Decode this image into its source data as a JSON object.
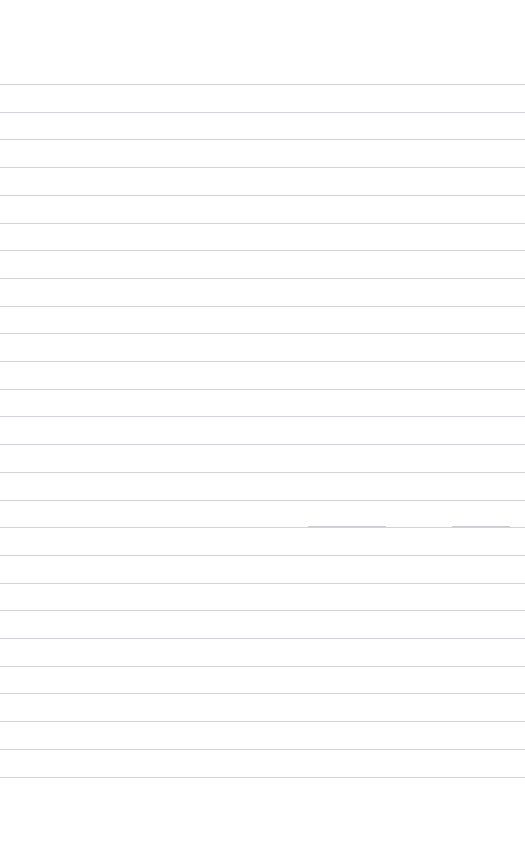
{
  "page": {
    "width": 525,
    "height": 862,
    "background_color": "#ffffff",
    "content_text": "",
    "state": "blank"
  },
  "ruling": {
    "style": "wide-ruled",
    "line_count": 26,
    "first_line_y": 84,
    "line_spacing": 27.7,
    "line_color": "#c8ccd2",
    "line_thickness": 1,
    "line_inset_left": 0,
    "line_inset_right": 0,
    "top_margin": 84,
    "bottom_margin": 86,
    "has_vertical_margin_rule": false,
    "lines_y": [
      84,
      111.7,
      139.4,
      167.1,
      194.8,
      222.5,
      250.2,
      277.9,
      305.6,
      333.3,
      361.0,
      388.7,
      416.4,
      444.1,
      471.8,
      499.5,
      527.2,
      554.9,
      582.6,
      610.3,
      638.0,
      665.7,
      693.4,
      721.1,
      748.8,
      776.5
    ]
  },
  "marks": {
    "description": "faint scan / ink streaks overlaying one ruled line",
    "color": "#9aa0a8",
    "items": [
      {
        "x": 308,
        "y": 526,
        "width": 78
      },
      {
        "x": 452,
        "y": 526,
        "width": 58
      }
    ]
  }
}
